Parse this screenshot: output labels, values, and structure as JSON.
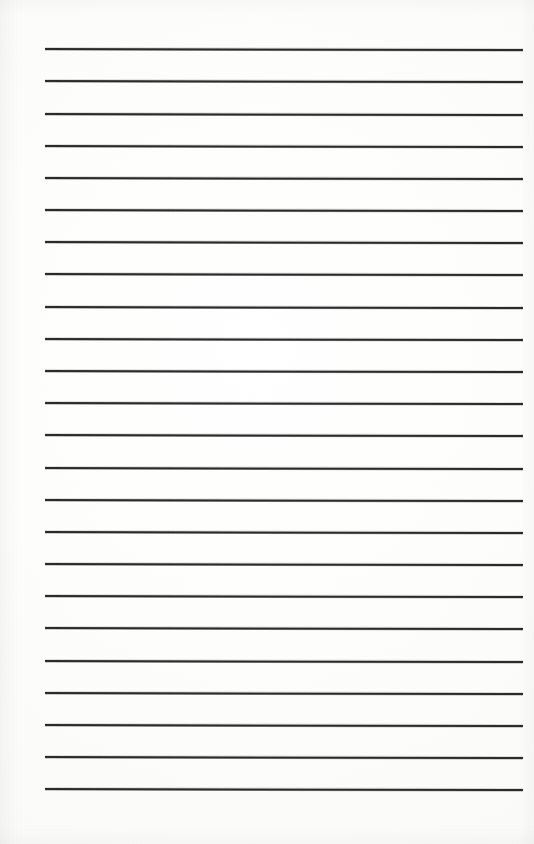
{
  "document": {
    "kind": "lined-paper-scan",
    "title": "Blank ruled notebook page",
    "page_width_px": 534,
    "page_height_px": 844,
    "background_color": "#fdfdfb",
    "content_text": "",
    "has_handwriting": false,
    "has_printed_text": false,
    "has_margin_rule": false,
    "has_holes": false
  },
  "ruling": {
    "line_color": "#2b2b2b",
    "line_thickness_px": 1.5,
    "line_count": 24,
    "left_edge_px": 45,
    "right_edge_px": 523,
    "line_length_px": 478,
    "first_line_y_px": 49,
    "last_line_y_px": 789,
    "line_spacing_px": 32.17,
    "skew_deg": 0.12,
    "lines": [
      {
        "index": 1,
        "y": 49.0,
        "x_start": 45,
        "x_end": 523
      },
      {
        "index": 2,
        "y": 81.2,
        "x_start": 45,
        "x_end": 523
      },
      {
        "index": 3,
        "y": 113.3,
        "x_start": 45,
        "x_end": 523
      },
      {
        "index": 4,
        "y": 145.5,
        "x_start": 45,
        "x_end": 523
      },
      {
        "index": 5,
        "y": 177.7,
        "x_start": 45,
        "x_end": 523
      },
      {
        "index": 6,
        "y": 209.9,
        "x_start": 45,
        "x_end": 523
      },
      {
        "index": 7,
        "y": 242.0,
        "x_start": 45,
        "x_end": 523
      },
      {
        "index": 8,
        "y": 274.2,
        "x_start": 45,
        "x_end": 523
      },
      {
        "index": 9,
        "y": 306.4,
        "x_start": 45,
        "x_end": 523
      },
      {
        "index": 10,
        "y": 338.6,
        "x_start": 45,
        "x_end": 523
      },
      {
        "index": 11,
        "y": 370.7,
        "x_start": 45,
        "x_end": 523
      },
      {
        "index": 12,
        "y": 402.9,
        "x_start": 45,
        "x_end": 523
      },
      {
        "index": 13,
        "y": 435.1,
        "x_start": 45,
        "x_end": 523
      },
      {
        "index": 14,
        "y": 467.3,
        "x_start": 45,
        "x_end": 523
      },
      {
        "index": 15,
        "y": 499.4,
        "x_start": 45,
        "x_end": 523
      },
      {
        "index": 16,
        "y": 531.6,
        "x_start": 45,
        "x_end": 523
      },
      {
        "index": 17,
        "y": 563.8,
        "x_start": 45,
        "x_end": 523
      },
      {
        "index": 18,
        "y": 596.0,
        "x_start": 45,
        "x_end": 523
      },
      {
        "index": 19,
        "y": 628.1,
        "x_start": 45,
        "x_end": 523
      },
      {
        "index": 20,
        "y": 660.3,
        "x_start": 45,
        "x_end": 523
      },
      {
        "index": 21,
        "y": 692.5,
        "x_start": 45,
        "x_end": 523
      },
      {
        "index": 22,
        "y": 724.7,
        "x_start": 45,
        "x_end": 523
      },
      {
        "index": 23,
        "y": 756.8,
        "x_start": 45,
        "x_end": 523
      },
      {
        "index": 24,
        "y": 789.0,
        "x_start": 45,
        "x_end": 523
      }
    ]
  },
  "margins": {
    "top_px": 49,
    "bottom_px": 55,
    "left_px": 45,
    "right_px": 11
  }
}
